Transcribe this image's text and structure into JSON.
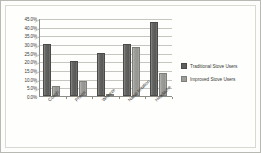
{
  "chart_data": {
    "type": "bar",
    "title": "",
    "xlabel": "",
    "ylabel": "",
    "categories": [
      "Cough",
      "Phelm",
      "Wheeze",
      "Nasal Irritation",
      "Headache"
    ],
    "series": [
      {
        "name": "Traditional Stove Users",
        "color": "#5f5f5d",
        "values": [
          30.0,
          20.0,
          25.0,
          30.0,
          42.5
        ]
      },
      {
        "name": "Improved Stove Users",
        "color": "#9d9d99",
        "values": [
          6.0,
          8.5,
          0.8,
          28.0,
          13.0
        ]
      }
    ],
    "ylim": [
      0.0,
      45.0
    ],
    "ytick_values": [
      0.0,
      5.0,
      10.0,
      15.0,
      20.0,
      25.0,
      30.0,
      35.0,
      40.0,
      45.0
    ],
    "ytick_labels": [
      "0.0%",
      "5.0%",
      "10.0%",
      "15.0%",
      "20.0%",
      "25.0%",
      "30.0%",
      "35.0%",
      "40.0%",
      "45.0%"
    ],
    "grid": true,
    "legend_position": "right"
  }
}
